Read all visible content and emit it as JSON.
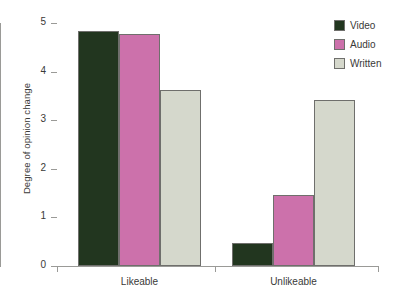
{
  "chart_data": {
    "type": "bar",
    "title": "",
    "xlabel": "",
    "ylabel": "Degree of opinion change",
    "categories": [
      "Likeable",
      "Unlikeable"
    ],
    "series": [
      {
        "name": "Video",
        "color": "#22361f",
        "values": [
          4.83,
          0.47
        ]
      },
      {
        "name": "Audio",
        "color": "#cc71ab",
        "values": [
          4.77,
          1.47
        ]
      },
      {
        "name": "Written",
        "color": "#d5d8cc",
        "values": [
          3.62,
          3.42
        ]
      }
    ],
    "ylim": [
      0,
      5
    ],
    "yticks": [
      0,
      1,
      2,
      3,
      4,
      5
    ],
    "ytick_labels": [
      "0",
      "1",
      "2",
      "3",
      "4",
      "5"
    ],
    "grid": false,
    "legend_position": "top-right"
  },
  "legend": {
    "entries": [
      {
        "label": "Video",
        "color": "#22361f"
      },
      {
        "label": "Audio",
        "color": "#cc71ab"
      },
      {
        "label": "Written",
        "color": "#d5d8cc"
      }
    ]
  },
  "axes": {
    "y_label": "Degree of opinion change",
    "y_tick_labels": [
      "5",
      "4",
      "3",
      "2",
      "1",
      "0"
    ],
    "x_tick_labels": [
      "Likeable",
      "Unlikeable"
    ]
  },
  "colors": {
    "axis": "#9a9a97",
    "text": "#3a3a38",
    "background": "#ffffff",
    "bar_edge": "#6f6f6c"
  }
}
